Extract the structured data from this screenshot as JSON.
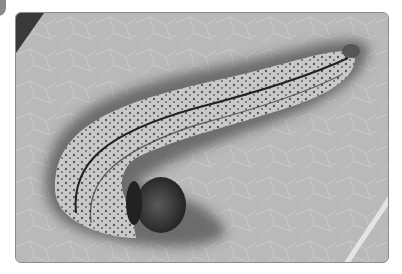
{
  "image": {
    "subject": "caterpillar on leaf",
    "style": "grayscale photograph",
    "colors": {
      "leaf": "#b8b8b8",
      "leaf_vein": "#d6d6d6",
      "shadow": "#6a6a6a",
      "body": "#c8c8c8",
      "stripe": "#2a2a2a",
      "head": "#2e2e2e",
      "dark_corner": "#3a3a3a",
      "frame": "#8c8c8c"
    }
  }
}
